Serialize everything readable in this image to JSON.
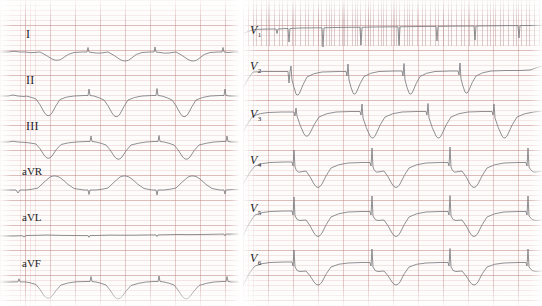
{
  "image": {
    "kind": "ecg-strip",
    "title": "12-lead electrocardiogram",
    "width": 542,
    "height": 306,
    "paper_color": "#fdfcfb",
    "grid_color": "#cc9696",
    "trace_color": "#7c7c80"
  },
  "panels": {
    "limb": {
      "name": "limb-leads-panel",
      "leads": [
        {
          "id": "I",
          "label": "I",
          "label_x": 26,
          "label_y": 28,
          "baseline": 52,
          "beats": 3,
          "morphology": "small negative QRS with broad shallow Q-wave troughs and upright P before each complex"
        },
        {
          "id": "II",
          "label": "II",
          "label_x": 26,
          "label_y": 74,
          "baseline": 96,
          "beats": 3,
          "morphology": "deep narrow negative QS complexes with slurred return to baseline"
        },
        {
          "id": "III",
          "label": "III",
          "label_x": 26,
          "label_y": 120,
          "baseline": 142,
          "beats": 3,
          "morphology": "moderate negative QS complexes, shallower than lead II"
        },
        {
          "id": "aVR",
          "label": "aVR",
          "label_x": 24,
          "label_y": 166,
          "baseline": 190,
          "beats": 3,
          "morphology": "upright rounded positive deflections with small preceding negative notch"
        },
        {
          "id": "aVL",
          "label": "aVL",
          "label_x": 24,
          "label_y": 212,
          "baseline": 236,
          "beats": 3,
          "morphology": "nearly isoelectric flat baseline with tiny low-amplitude complexes"
        },
        {
          "id": "aVF",
          "label": "aVF",
          "label_x": 24,
          "label_y": 258,
          "baseline": 282,
          "beats": 3,
          "morphology": "negative QS complexes of intermediate depth with small upright spikes"
        }
      ]
    },
    "chest": {
      "name": "chest-leads-panel",
      "leads": [
        {
          "id": "V1",
          "label": "V",
          "sub": "1",
          "label_x": 252,
          "label_y": 28,
          "baseline": 30,
          "beats": 5,
          "morphology": "flat high baseline with deep narrow downward spikes, dense grid overprint"
        },
        {
          "id": "V2",
          "label": "V",
          "sub": "2",
          "label_x": 252,
          "label_y": 64,
          "baseline": 72,
          "beats": 4,
          "morphology": "rS pattern, sharp tall negative deflections with broad recovery"
        },
        {
          "id": "V3",
          "label": "V",
          "sub": "3",
          "label_x": 252,
          "label_y": 112,
          "baseline": 116,
          "beats": 4,
          "morphology": "deep wide negative QS complexes with rounded positive T hump"
        },
        {
          "id": "V4",
          "label": "V",
          "sub": "4",
          "label_x": 252,
          "label_y": 158,
          "baseline": 166,
          "beats": 4,
          "morphology": "small sharp positive R spike followed by deep wide S trough"
        },
        {
          "id": "V5",
          "label": "V",
          "sub": "5",
          "label_x": 252,
          "label_y": 206,
          "baseline": 214,
          "beats": 4,
          "morphology": "tall thin R spike then deep narrow S wave, rounded baseline between beats"
        },
        {
          "id": "V6",
          "label": "V",
          "sub": "6",
          "label_x": 252,
          "label_y": 256,
          "baseline": 266,
          "beats": 4,
          "morphology": "sharp positive R spike with moderately deep S wave and smooth T"
        }
      ]
    }
  },
  "traces": {
    "I": "M0,52 L8,52 Q14,50.5 20,52 L26,52 Q30,53 34,52.5 L40,52 Q46,55 52,59 Q58,62 63,58 Q68,53.5 74,52.5 L82,52 L87,52 L88,47.5 L89,52 L92,52.5 Q97,53.5 101,53 L108,52 Q114,55 120,59.5 Q126,63 131,58.5 Q136,53.5 142,52.5 L150,52 L154,52 L155,47 L156,52 L160,52.5 Q165,53.5 169,53 L176,52 Q182,55 188,59.5 Q194,63 199,58.5 Q204,53.5 210,52.5 L218,52 L222,52 L223,47.5 L224,52 L228,52.5 L234,52 L239,52",
    "II": "M0,96 L8,96 Q13,94 18,96 L24,96.5 L26,96 Q31,97 36,99 Q40,104 44,112 Q48,119 52,113 Q56,105 60,99.5 Q66,96.5 74,96 L84,95.5 L88,95.5 L89,89 L90,95.5 L94,96 Q99,97.5 104,100 Q108,105 112,113 Q116,120 120,114 Q124,106 128,100 Q134,97 142,96 L152,95.5 L156,95.5 L157,88.5 L158,95.5 L162,96 Q167,97.5 172,100 Q176,105 180,113 Q184,120 188,114 Q192,106 196,100 Q202,97 210,96 L220,95.5 L224,95.5 L225,89 L226,95.5 L230,96 L236,96 L239,96",
    "III": "M0,142 L8,142 Q13,140.5 18,142 L26,142.5 Q31,143 36,144 Q40,148 44,155 Q48,161 52,156 Q56,149 61,144.5 Q68,142.5 76,142 L86,141.5 L90,141.5 L91,136 L92,141.5 L96,142 Q101,143 106,145 Q110,149 114,156 Q118,162 122,157 Q126,150 131,145 Q138,143 146,142 L154,141.5 L158,141.5 L159,135.5 L160,141.5 L164,142 Q169,143 174,145 Q178,149 182,156 Q186,162 190,157 Q194,150 199,145 Q206,143 214,142 L222,141.5 L226,141.5 L227,136 L228,141.5 L232,142 L239,142",
    "aVR": "M0,190 L10,190 L16,190 L18,193 L20,190 L26,190 Q32,189.5 38,188 Q44,182 50,177 Q56,174 62,179 Q68,185 74,188.5 L84,190 L88,190 L89,194.5 L90,190 L96,190 Q102,189.5 108,188 Q114,182 120,177 Q126,174 132,179 Q138,185 144,188.5 L152,190 L156,190 L157,195 L158,190 L164,190 Q170,189.5 176,188 Q182,182 188,177 Q194,174 200,179 Q206,185 212,188.5 L220,190 L224,190 L225,194 L226,190 L232,189.5 L239,189.5",
    "aVL": "M0,236 L14,236 L22,235.7 L24,237 L26,235.5 L38,235.3 Q46,234.8 54,235.2 L62,235.4 L72,235.5 L84,235.6 L88,235.6 L89,237.3 L90,235.6 L100,235.4 Q110,234.9 120,235.2 L132,235.2 L144,235 L154,234.9 L156,234.9 L157,236.6 L158,234.9 L168,234.7 Q178,234.3 188,234.6 L200,234.5 L212,234.3 L222,234.1 L224,234.1 L225,235.8 L226,234.1 L232,234 L239,234",
    "aVF": "M0,282 L10,282 L18,281.8 L19,278.8 L20,281.8 L26,282 Q31,282.8 36,284.5 Q40,289 44,295.5 Q48,301 52,296 Q56,290 61,285 Q68,282.5 76,281.8 L86,281.5 L90,281.5 L91,276.5 L92,281.5 L96,282 Q101,283 106,285 Q110,289.5 114,296 Q118,301.5 122,296.5 Q126,290.5 131,285.5 Q138,283 146,282 L154,281.5 L158,281.5 L159,276 L160,281.5 L164,282 Q169,283 174,285 Q178,289.5 182,296 Q186,301.5 190,296.5 Q194,290.5 199,285.5 Q206,283 214,282 L222,281.5 L226,281.5 L227,276.5 L228,281.5 L232,282 L239,282",
    "V1": "M243,34 Q248,31 254,29.5 L268,29 L276,29 L277,33.5 L278,29 L286,28.5 L288,28.5 L289,42 L290,28.5 L300,28 L316,27.8 L322,27.8 L323,47 L324,27.8 L336,27.5 L352,27.3 L360,27.3 L361,45 L362,27.3 L374,27 L392,26.8 L398,26.8 L399,45.5 L400,26.8 L412,26.6 L430,26.4 L436,26.4 L437,41 L438,26.4 L450,26.2 L468,26 L474,26 L475,40 L476,26 L490,25.8 L510,25.6 L518,25.6 L519,38 L520,25.6 L530,25.5 L542,25.4",
    "V2": "M243,88 Q248,78 253,72 L264,71.5 L278,71.5 L288,71.5 L289,83 L290,71.5 L291,66 L292,80 Q294,88 296,94 Q298,97 300,92 Q303,84 307,77 Q313,73 322,72 L338,71.5 L346,71.5 L347,76 L348,64 L349,80 Q351,88 353,93 Q355,96 357,91 Q360,83 364,76.5 Q370,72.5 379,71.5 L394,71 L402,71 L403,76 L404,63.5 L405,80 Q407,88 409,93 Q411,96 413,91 Q416,83 420,76.5 Q426,72.5 435,71.5 L450,71 L458,71 L459,75 L460,63 L461,79 Q463,87 465,92 Q467,95 469,90 Q472,82 476,76 Q482,72 491,71 L506,70.5 L520,70.5 L530,70 Q536,68 542,66",
    "V3": "M243,132 Q248,122 253,116 Q260,113 268,112.5 L282,112 L294,112 L295,116 L296,108 L297,116 Q300,126 304,134 Q307,139 310,133 Q314,124 319,117 Q326,113 336,112 L350,111.5 L360,111.5 L361,115 L362,104 L363,118 Q366,128 370,136 Q373,141 376,134 Q380,124 385,117 Q392,113 402,112 L416,111.5 L426,111.5 L427,115 L428,103.5 L429,118 Q432,128 436,136 Q439,141 442,134 Q446,124 451,117 Q458,113 468,112 L482,111.5 L492,111.5 L493,115 L494,104 L495,118 Q498,128 502,136 Q505,141 508,134 Q512,124 517,117 Q524,113 534,112 L542,111",
    "V4": "M243,185 Q249,172 255,166 Q262,163 270,162.5 L284,162 L292,162 L293,166 L294,150 L295,167 Q297,173 300,172 L306,171 Q310,176 314,184 Q318,191 322,184 Q326,175 331,168 Q338,164 348,163 L362,162.5 L370,162.5 L371,166 L372,148 L373,167 Q375,173 378,172 L384,171 Q388,176 392,184 Q396,191 400,184 Q404,175 409,168 Q416,164 426,163 L440,162.5 L448,162.5 L449,166 L450,147 L451,167 Q453,173 456,172 L462,171 Q466,176 470,184 Q474,191 478,184 Q482,175 487,168 Q494,164 504,163 L518,162.5 L526,162.5 L527,166 L528,148 L529,167 Q532,173 536,172 L542,171",
    "V5": "M243,236 Q249,222 255,215 Q262,212 270,211.5 L284,211 L292,211 L293,215 L294,197 L295,216 Q297,221 300,220.5 L306,220 Q310,225 314,233 Q318,240 322,233 Q326,224 331,217 Q338,213 348,212 L362,211.5 L370,211.5 L371,215 L372,196 L373,216 Q375,221 378,220.5 L384,220 Q388,225 392,233 Q396,240 400,233 Q404,224 409,217 Q416,213 426,212 L440,211.5 L448,211.5 L449,215 L450,195.5 L451,216 Q453,221 456,220.5 L462,220 Q466,225 470,233 Q474,240 478,233 Q482,224 487,217 Q494,213 504,212 L518,211.5 L526,211.5 L527,215 L528,196 L529,216 Q532,221 536,220.5 L542,220",
    "V6": "M243,286 Q249,272 255,266 Q262,263 270,262.5 L284,262 L292,262 L293,266 L294,250 L295,267 Q297,272 300,271.5 L306,271 Q310,275 314,282 Q318,288 322,282 Q326,273 331,267 Q338,263.5 348,263 L362,262.5 L370,262.5 L371,266 L372,249 L373,267 Q375,272 378,271.5 L384,271 Q388,275 392,282 Q396,288 400,282 Q404,273 409,267 Q416,263.5 426,263 L440,262.5 L448,262.5 L449,266 L450,248.5 L451,267 Q453,272 456,271.5 L462,271 Q466,275 470,282 Q474,288 478,282 Q482,273 487,267 Q494,263.5 504,263 L518,262.5 L526,262.5 L527,266 L528,249 L529,267 Q532,272 536,271.5 L542,271"
  }
}
